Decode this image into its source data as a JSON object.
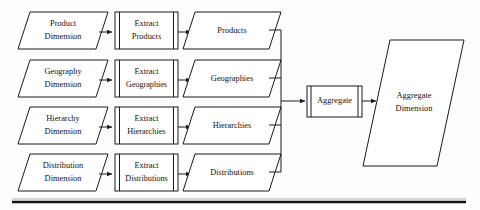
{
  "diagram": {
    "type": "flowchart",
    "colors": {
      "stroke": "#1a1a1a",
      "fill": "#ffffff",
      "text": "#111111",
      "rule": "#111111"
    },
    "rows": [
      {
        "id": "product",
        "source": {
          "line1": "Product",
          "line2": "Dimension"
        },
        "process": {
          "line1": "Extract",
          "line2": "Products"
        },
        "output": {
          "line1": "Products"
        }
      },
      {
        "id": "geography",
        "source": {
          "line1": "Geography",
          "line2": "Dimension"
        },
        "process": {
          "line1": "Extract",
          "line2": "Geographies"
        },
        "output": {
          "line1": "Geographies"
        }
      },
      {
        "id": "hierarchy",
        "source": {
          "line1": "Hierarchy",
          "line2": "Dimension"
        },
        "process": {
          "line1": "Extract",
          "line2": "Hierarchies"
        },
        "output": {
          "line1": "Hierarchies"
        }
      },
      {
        "id": "distribution",
        "source": {
          "line1": "Distribution",
          "line2": "Dimension"
        },
        "process": {
          "line1": "Extract",
          "line2": "Distributions"
        },
        "output": {
          "line1": "Distributions"
        }
      }
    ],
    "aggregate": {
      "process": {
        "line1": "Aggregate"
      },
      "result": {
        "line1": "Aggregate",
        "line2": "Dimension"
      }
    }
  }
}
